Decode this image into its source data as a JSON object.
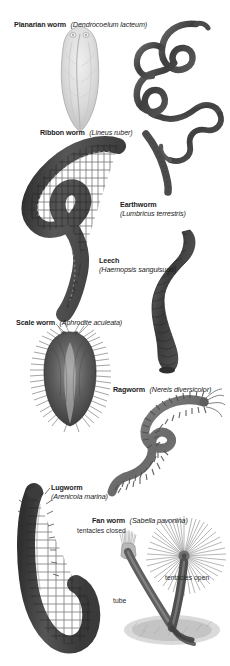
{
  "plate": {
    "title": "Worms illustration plate",
    "background_color": "#ffffff",
    "ink_color": "#3a3a3a"
  },
  "specimens": [
    {
      "id": "planarian",
      "common_name": "Planarian worm",
      "scientific_name": "(Dendrocoelum lacteum)",
      "label_layout": "inline",
      "label_x": 14,
      "label_y": 12,
      "tone": "#cfcfcf"
    },
    {
      "id": "ribbon-worm",
      "common_name": "Ribbon worm",
      "scientific_name": "(Lineus ruber)",
      "label_layout": "inline",
      "label_x": 40,
      "label_y": 120,
      "tone": "#555555"
    },
    {
      "id": "earthworm",
      "common_name": "Earthworm",
      "scientific_name": "(Lumbricus terrestris)",
      "label_layout": "stack",
      "label_x": 120,
      "label_y": 200,
      "tone": "#4a4a4a"
    },
    {
      "id": "leech",
      "common_name": "Leech",
      "scientific_name": "(Haemopsis sanguisuga)",
      "label_layout": "stack",
      "label_x": 99,
      "label_y": 256,
      "tone": "#4f4f4f"
    },
    {
      "id": "scale-worm",
      "common_name": "Scale worm",
      "scientific_name": "(Aphrodite aculeata)",
      "label_layout": "inline",
      "label_x": 16,
      "label_y": 310,
      "tone": "#5a5a5a"
    },
    {
      "id": "ragworm",
      "common_name": "Ragworm",
      "scientific_name": "(Nereis diversicolor)",
      "label_layout": "inline",
      "label_x": 113,
      "label_y": 377,
      "tone": "#777777"
    },
    {
      "id": "lugworm",
      "common_name": "Lugworm",
      "scientific_name": "(Arenicola marina)",
      "label_layout": "stack",
      "label_x": 51,
      "label_y": 483,
      "tone": "#555555"
    },
    {
      "id": "fan-worm",
      "common_name": "Fan worm",
      "scientific_name": "(Sabella pavonina)",
      "label_layout": "inline",
      "label_x": 92,
      "label_y": 508,
      "tone": "#6b6b6b"
    }
  ],
  "annotations": [
    {
      "id": "tentacles-closed",
      "text": "tentacles closed",
      "x": 77,
      "y": 527
    },
    {
      "id": "tentacles-open",
      "text": "tentacles open",
      "x": 165,
      "y": 574
    },
    {
      "id": "tube",
      "text": "tube",
      "x": 113,
      "y": 597
    }
  ]
}
